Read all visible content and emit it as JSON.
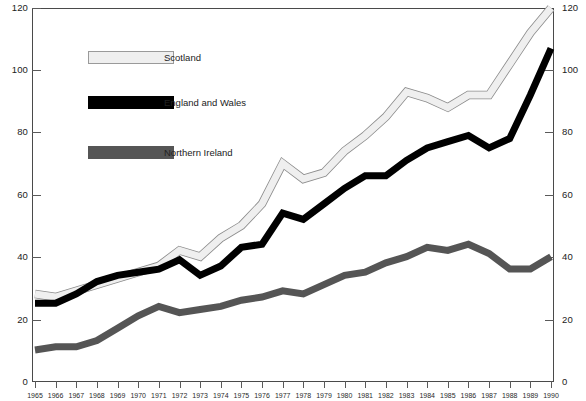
{
  "chart_data": {
    "type": "line",
    "title": "",
    "subtitle": "",
    "xlabel": "",
    "ylabel": "",
    "ylim": [
      0,
      120
    ],
    "ytick_step": 20,
    "yticks": [
      0,
      20,
      40,
      60,
      80,
      100,
      120
    ],
    "yticks_right": [
      0,
      20,
      40,
      60,
      80,
      100,
      120
    ],
    "grid": false,
    "legend_position": "upper-left-inside",
    "x": [
      1965,
      1966,
      1967,
      1968,
      1969,
      1970,
      1971,
      1972,
      1973,
      1974,
      1975,
      1976,
      1977,
      1978,
      1979,
      1980,
      1981,
      1982,
      1983,
      1984,
      1985,
      1986,
      1987,
      1988,
      1989,
      1990
    ],
    "categories": [
      "1965",
      "1966",
      "1967",
      "1968",
      "1969",
      "1970",
      "1971",
      "1972",
      "1973",
      "1974",
      "1975",
      "1976",
      "1977",
      "1978",
      "1979",
      "1980",
      "1981",
      "1982",
      "1983",
      "1984",
      "1985",
      "1986",
      "1987",
      "1988",
      "1989",
      "1990"
    ],
    "series": [
      {
        "name": "Scotland",
        "color": "#efefef",
        "stroke": "#8c8c8c",
        "values": [
          28,
          27,
          29,
          31,
          33,
          35,
          37,
          42,
          40,
          46,
          50,
          57,
          70,
          65,
          67,
          74,
          79,
          85,
          93,
          91,
          88,
          92,
          92,
          102,
          112,
          120
        ]
      },
      {
        "name": "England and Wales",
        "color": "#000000",
        "stroke": "#000000",
        "values": [
          25,
          25,
          28,
          32,
          34,
          35,
          36,
          39,
          34,
          37,
          43,
          44,
          54,
          52,
          57,
          62,
          66,
          66,
          71,
          75,
          77,
          79,
          75,
          78,
          92,
          107
        ]
      },
      {
        "name": "Northern Ireland",
        "color": "#555555",
        "stroke": "#555555",
        "values": [
          10,
          11,
          11,
          13,
          17,
          21,
          24,
          22,
          23,
          24,
          26,
          27,
          29,
          28,
          31,
          34,
          35,
          38,
          40,
          43,
          42,
          44,
          41,
          36,
          36,
          40
        ]
      }
    ]
  },
  "legend": {
    "items": [
      {
        "label": "Scotland"
      },
      {
        "label": "England and Wales"
      },
      {
        "label": "Northern Ireland"
      }
    ]
  },
  "axes": {
    "left_ticks": [
      "120",
      "100",
      "80",
      "60",
      "40",
      "20",
      "0"
    ],
    "right_ticks": [
      "120",
      "100",
      "80",
      "60",
      "40",
      "20",
      "0"
    ]
  }
}
